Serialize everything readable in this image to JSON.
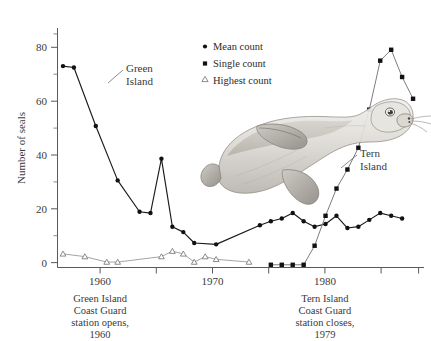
{
  "chart_data": {
    "type": "line",
    "title": "",
    "subtitle": "",
    "xlabel": "",
    "ylabel": "Number of seals",
    "xlim": [
      1955.5,
      1989.0
    ],
    "ylim": [
      0,
      88
    ],
    "grid": false,
    "x_ticks_major": [
      1960,
      1970,
      1980
    ],
    "x_ticks_major_labels": [
      "1960",
      "1970",
      "1980"
    ],
    "x_ticks_minor": [
      1965,
      1975,
      1985
    ],
    "y_ticks_major": [
      0,
      20,
      40,
      60,
      80
    ],
    "y_ticks_major_labels": [
      "0",
      "20",
      "40",
      "60",
      "80"
    ],
    "y_ticks_minor": [
      10,
      30,
      50,
      70
    ],
    "legend_position": "top-right",
    "series": [
      {
        "name": "Mean count",
        "marker": "circle",
        "color": "#111111",
        "label_on_plot": "Green Island",
        "x": [
          1956,
          1957,
          1959,
          1961,
          1963,
          1964,
          1965,
          1966,
          1967,
          1968,
          1970,
          1974,
          1975,
          1976,
          1977,
          1978,
          1979,
          1980,
          1981,
          1982,
          1983,
          1984,
          1985,
          1986,
          1987
        ],
        "y": [
          74,
          73.5,
          52,
          32,
          20.5,
          20,
          40,
          15,
          13,
          9,
          8.5,
          15.5,
          17,
          18,
          20,
          17,
          15,
          16,
          19,
          14.5,
          15,
          17.5,
          20,
          19,
          18
        ]
      },
      {
        "name": "Single count",
        "marker": "square",
        "color": "#111111",
        "label_on_plot": "Tern Island",
        "x": [
          1975,
          1976,
          1977,
          1978,
          1979,
          1980,
          1981,
          1982,
          1983,
          1984,
          1985,
          1986,
          1987,
          1988
        ],
        "y": [
          1,
          1,
          1,
          1,
          8,
          19,
          29,
          36,
          44,
          58,
          76,
          80,
          70,
          62
        ]
      },
      {
        "name": "Highest count",
        "marker": "triangle",
        "color": "#9a9a9a",
        "label_on_plot": "",
        "x": [
          1956,
          1958,
          1960,
          1961,
          1965,
          1966,
          1967,
          1968,
          1969,
          1970,
          1973
        ],
        "y": [
          5,
          4,
          2,
          2,
          4,
          6,
          5,
          2,
          4,
          3,
          2
        ]
      }
    ],
    "annotations": [
      {
        "name": "green-island-event",
        "x": 1960,
        "lines": [
          "Green Island",
          "Coast Guard",
          "station opens,",
          "1960"
        ]
      },
      {
        "name": "tern-island-event",
        "x": 1980,
        "lines": [
          "Tern Island",
          "Coast Guard",
          "station closes,",
          "1979"
        ]
      }
    ],
    "plot_labels": [
      {
        "name": "green-island-label",
        "lines": [
          "Green",
          "Island"
        ]
      },
      {
        "name": "tern-island-label",
        "lines": [
          "Tern",
          "Island"
        ]
      }
    ],
    "illustration": {
      "name": "seal-illustration",
      "alt": "monk seal drawing"
    }
  },
  "legend": {
    "items": [
      {
        "label": "Mean count",
        "marker": "circle"
      },
      {
        "label": "Single count",
        "marker": "square"
      },
      {
        "label": "Highest count",
        "marker": "triangle"
      }
    ]
  }
}
